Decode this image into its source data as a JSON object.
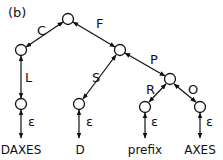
{
  "figure_label": "(b)",
  "nodes": [
    {
      "id": "root",
      "x": 68,
      "y": 19
    },
    {
      "id": "c_node",
      "x": 21,
      "y": 50
    },
    {
      "id": "f_node",
      "x": 120,
      "y": 50
    },
    {
      "id": "l_node",
      "x": 21,
      "y": 104
    },
    {
      "id": "s_node",
      "x": 79,
      "y": 104
    },
    {
      "id": "p_node",
      "x": 170,
      "y": 79
    },
    {
      "id": "r_node",
      "x": 145,
      "y": 107
    },
    {
      "id": "o_node",
      "x": 200,
      "y": 107
    }
  ],
  "edges": [
    {
      "from": "root",
      "to": "c_node",
      "label": "C"
    },
    {
      "from": "root",
      "to": "f_node",
      "label": "F"
    },
    {
      "from": "c_node",
      "to": "l_node",
      "label": "L"
    },
    {
      "from": "f_node",
      "to": "s_node",
      "label": "S"
    },
    {
      "from": "f_node",
      "to": "p_node",
      "label": "P"
    },
    {
      "from": "p_node",
      "to": "r_node",
      "label": "R"
    },
    {
      "from": "p_node",
      "to": "o_node",
      "label": "O"
    }
  ],
  "epsilon_symbol": "ε",
  "leaves": [
    {
      "node": "l_node",
      "label": "DAXES"
    },
    {
      "node": "s_node",
      "label": "D"
    },
    {
      "node": "r_node",
      "label": "prefix"
    },
    {
      "node": "o_node",
      "label": "AXES"
    }
  ]
}
